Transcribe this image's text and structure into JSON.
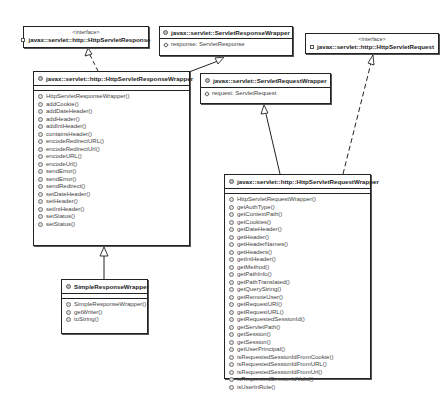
{
  "diagram": {
    "type": "uml-class-diagram",
    "classes": {
      "http_servlet_response": {
        "stereotype": "<interface>",
        "name": "javax::servlet::http::HttpServletResponse",
        "icon": "interface-icon"
      },
      "servlet_response_wrapper": {
        "name": "javax::servlet::ServletResponseWrapper",
        "icon": "class-icon",
        "fields": [
          "response: ServletResponse"
        ]
      },
      "http_servlet_request": {
        "stereotype": "<interface>",
        "name": "javax::servlet::http::HttpServletRequest",
        "icon": "interface-icon"
      },
      "http_servlet_response_wrapper": {
        "name": "javax::servlet::http::HttpServletResponseWrapper",
        "icon": "class-icon",
        "fields": [],
        "methods": [
          "HttpServletResponseWrapper()",
          "addCookie()",
          "addDateHeader()",
          "addHeader()",
          "addIntHeader()",
          "containsHeader()",
          "encodeRedirectURL()",
          "encodeRedirectUrl()",
          "encodeURL()",
          "encodeUrl()",
          "sendError()",
          "sendError()",
          "sendRedirect()",
          "setDateHeader()",
          "setHeader()",
          "setIntHeader()",
          "setStatus()",
          "setStatus()"
        ]
      },
      "servlet_request_wrapper": {
        "name": "javax::servlet::ServletRequestWrapper",
        "icon": "class-icon",
        "fields": [
          "request: ServletRequest"
        ]
      },
      "simple_response_wrapper": {
        "name": "SimpleResponseWrapper",
        "icon": "class-icon",
        "fields": [],
        "methods": [
          "SimpleResponseWrapper()",
          "getWriter()",
          "toString()"
        ]
      },
      "http_servlet_request_wrapper": {
        "name": "javax::servlet::http::HttpServletRequestWrapper",
        "icon": "class-icon",
        "fields": [],
        "methods": [
          "HttpServletRequestWrapper()",
          "getAuthType()",
          "getContextPath()",
          "getCookies()",
          "getDateHeader()",
          "getHeader()",
          "getHeaderNames()",
          "getHeaders()",
          "getIntHeader()",
          "getMethod()",
          "getPathInfo()",
          "getPathTranslated()",
          "getQueryString()",
          "getRemoteUser()",
          "getRequestURI()",
          "getRequestURL()",
          "getRequestedSessionId()",
          "getServletPath()",
          "getSession()",
          "getSession()",
          "getUserPrincipal()",
          "isRequestedSessionIdFromCookie()",
          "isRequestedSessionIdFromURL()",
          "isRequestedSessionIdFromUrl()",
          "isRequestedSessionIdValid()",
          "isUserInRole()"
        ]
      }
    },
    "relationships": [
      {
        "from": "HttpServletResponseWrapper",
        "to": "HttpServletResponse",
        "kind": "realization"
      },
      {
        "from": "HttpServletResponseWrapper",
        "to": "ServletResponseWrapper",
        "kind": "generalization"
      },
      {
        "from": "SimpleResponseWrapper",
        "to": "HttpServletResponseWrapper",
        "kind": "generalization"
      },
      {
        "from": "HttpServletRequestWrapper",
        "to": "ServletRequestWrapper",
        "kind": "generalization"
      },
      {
        "from": "HttpServletRequestWrapper",
        "to": "HttpServletRequest",
        "kind": "realization"
      }
    ],
    "colors": {
      "border": "#222222",
      "text": "#444444",
      "background": "#ffffff"
    }
  }
}
